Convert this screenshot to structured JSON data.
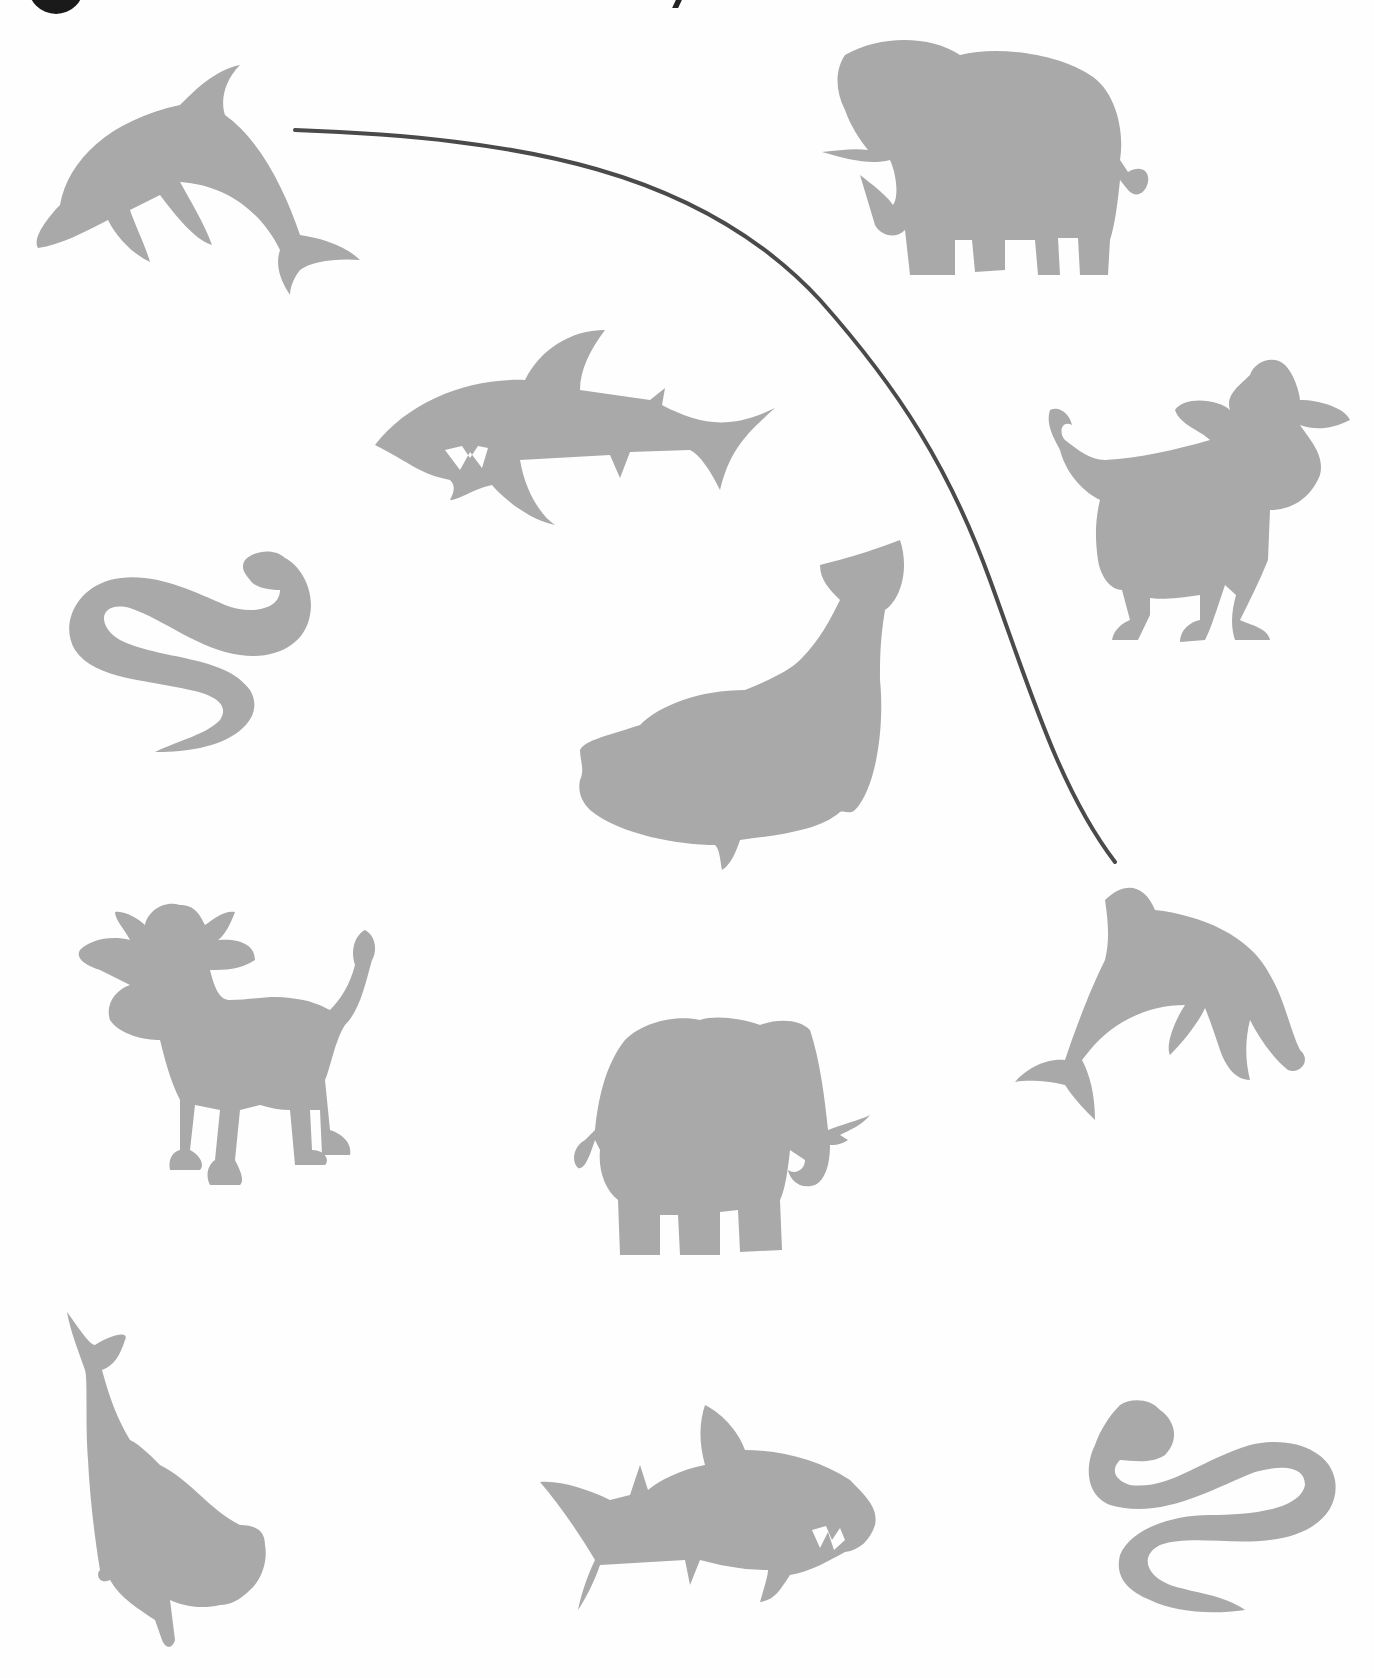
{
  "worksheet": {
    "header": {
      "number_badge": "",
      "title_fragment": ""
    },
    "colors": {
      "silhouette": "#a9a9a9",
      "line": "#4a4a4a",
      "background": "#ffffff"
    },
    "animals": [
      {
        "id": "dolphin-top-left",
        "kind": "dolphin",
        "column": "left"
      },
      {
        "id": "elephant-top-right",
        "kind": "elephant",
        "column": "right"
      },
      {
        "id": "shark-middle",
        "kind": "shark",
        "column": "middle"
      },
      {
        "id": "cow-right",
        "kind": "cow",
        "column": "right"
      },
      {
        "id": "worm-left",
        "kind": "worm",
        "column": "left"
      },
      {
        "id": "whale-middle",
        "kind": "whale",
        "column": "middle"
      },
      {
        "id": "cow-left",
        "kind": "cow",
        "column": "left"
      },
      {
        "id": "elephant-middle",
        "kind": "elephant",
        "column": "middle"
      },
      {
        "id": "dolphin-right",
        "kind": "dolphin",
        "column": "right"
      },
      {
        "id": "whale-bottom-left",
        "kind": "whale",
        "column": "left"
      },
      {
        "id": "shark-bottom-middle",
        "kind": "shark",
        "column": "middle"
      },
      {
        "id": "worm-bottom-right",
        "kind": "worm",
        "column": "right"
      }
    ],
    "connections": [
      {
        "from": "dolphin-top-left",
        "to": "dolphin-right",
        "label": "example match line"
      }
    ]
  }
}
